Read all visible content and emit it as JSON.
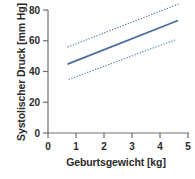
{
  "chart_data": {
    "type": "line",
    "title": "",
    "subtitle": "",
    "xlabel": "Geburtsgewicht [kg]",
    "ylabel": "Systolischer Druck [mm Hg]",
    "xlim": [
      0,
      5
    ],
    "ylim": [
      0,
      80
    ],
    "xticks": [
      0,
      1,
      2,
      3,
      4,
      5
    ],
    "yticks": [
      0,
      20,
      40,
      60,
      80
    ],
    "xtick_labels": [
      "0",
      "1",
      "2",
      "3",
      "4",
      "5"
    ],
    "ytick_labels": [
      "0",
      "20",
      "40",
      "60",
      "80"
    ],
    "grid": false,
    "legend": "none",
    "annotations": [],
    "series": [
      {
        "name": "Regressionsgerade",
        "style": "solid",
        "color": "#4a6d9c",
        "x": [
          0.72,
          4.62
        ],
        "values": [
          45.0,
          73.0
        ]
      },
      {
        "name": "Oberes Konfidenzband",
        "style": "dotted",
        "color": "#5a7ba8",
        "x": [
          0.72,
          4.68
        ],
        "values": [
          56.0,
          84.0
        ]
      },
      {
        "name": "Unteres Konfidenzband",
        "style": "dotted",
        "color": "#5a7ba8",
        "x": [
          0.76,
          4.6
        ],
        "values": [
          35.0,
          61.0
        ]
      }
    ]
  },
  "axis": {
    "color": "#6e6e6e",
    "tick_color": "#6e6e6e",
    "label_color": "#2b2b2b"
  }
}
